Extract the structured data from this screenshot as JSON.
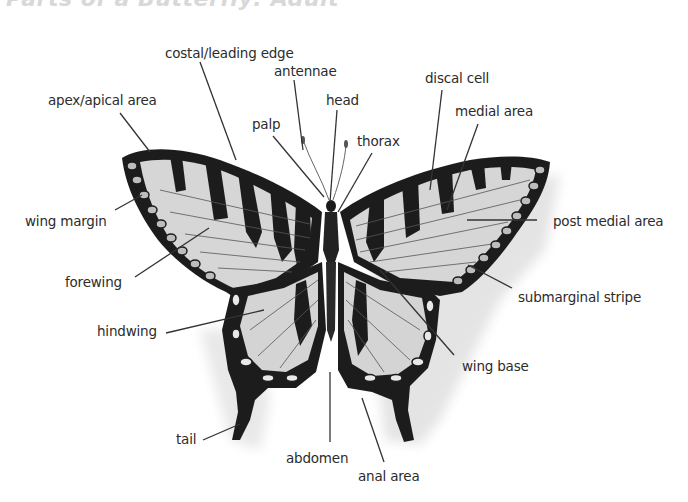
{
  "title": "Parts of a Butterfly: Adult",
  "colors": {
    "text": "#2c2c2c",
    "leader_line": "#333333",
    "wing_fill": "#d4d4d4",
    "wing_dark": "#1e1e1e",
    "shadow": "#e2e2e2",
    "title": "#d8d8d8"
  },
  "labels": [
    {
      "id": "costal",
      "text": "costal/leading edge",
      "x": 165,
      "y": 45,
      "line": [
        [
          200,
          62
        ],
        [
          236,
          160
        ]
      ]
    },
    {
      "id": "antennae",
      "text": "antennae",
      "x": 274,
      "y": 63,
      "line": [
        [
          294,
          80
        ],
        [
          303,
          150
        ]
      ]
    },
    {
      "id": "apex",
      "text": "apex/apical area",
      "x": 48,
      "y": 92,
      "line": [
        [
          120,
          113
        ],
        [
          150,
          152
        ]
      ]
    },
    {
      "id": "head",
      "text": "head",
      "x": 326,
      "y": 92,
      "line": [
        [
          337,
          110
        ],
        [
          330,
          202
        ]
      ]
    },
    {
      "id": "discal",
      "text": "discal cell",
      "x": 425,
      "y": 70,
      "line": [
        [
          442,
          90
        ],
        [
          430,
          190
        ]
      ]
    },
    {
      "id": "medial",
      "text": "medial area",
      "x": 455,
      "y": 103,
      "line": [
        [
          478,
          124
        ],
        [
          447,
          210
        ]
      ]
    },
    {
      "id": "palp",
      "text": "palp",
      "x": 252,
      "y": 116,
      "line": [
        [
          273,
          136
        ],
        [
          324,
          197
        ]
      ]
    },
    {
      "id": "thorax",
      "text": "thorax",
      "x": 357,
      "y": 133,
      "line": [
        [
          372,
          153
        ],
        [
          338,
          212
        ]
      ]
    },
    {
      "id": "wing_margin",
      "text": "wing margin",
      "x": 25,
      "y": 213,
      "line": [
        [
          115,
          210
        ],
        [
          142,
          195
        ]
      ]
    },
    {
      "id": "post_medial",
      "text": "post medial area",
      "x": 553,
      "y": 213,
      "line": [
        [
          537,
          220
        ],
        [
          467,
          220
        ]
      ]
    },
    {
      "id": "forewing",
      "text": "forewing",
      "x": 65,
      "y": 274,
      "line": [
        [
          135,
          277
        ],
        [
          209,
          228
        ]
      ]
    },
    {
      "id": "submarginal",
      "text": "submarginal stripe",
      "x": 518,
      "y": 289,
      "line": [
        [
          512,
          288
        ],
        [
          468,
          265
        ]
      ]
    },
    {
      "id": "hindwing",
      "text": "hindwing",
      "x": 97,
      "y": 323,
      "line": [
        [
          166,
          333
        ],
        [
          264,
          310
        ]
      ]
    },
    {
      "id": "wing_base",
      "text": "wing base",
      "x": 462,
      "y": 358,
      "line": [
        [
          454,
          355
        ],
        [
          380,
          270
        ]
      ]
    },
    {
      "id": "tail",
      "text": "tail",
      "x": 176,
      "y": 431,
      "line": [
        [
          203,
          440
        ],
        [
          240,
          424
        ]
      ]
    },
    {
      "id": "abdomen",
      "text": "abdomen",
      "x": 286,
      "y": 450,
      "line": [
        [
          330,
          442
        ],
        [
          330,
          372
        ]
      ]
    },
    {
      "id": "anal_area",
      "text": "anal area",
      "x": 358,
      "y": 468,
      "line": [
        [
          384,
          462
        ],
        [
          362,
          398
        ]
      ]
    }
  ]
}
